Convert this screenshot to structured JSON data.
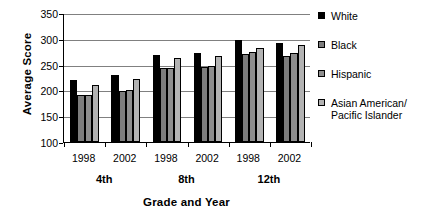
{
  "chart_data": {
    "type": "bar",
    "title": "",
    "xlabel": "Grade and Year",
    "ylabel": "Average Score",
    "ylim": [
      100,
      350
    ],
    "yticks": [
      100,
      150,
      200,
      250,
      300,
      350
    ],
    "grid": true,
    "legend_position": "right",
    "categories": [
      "4th 1998",
      "4th 2002",
      "8th 1998",
      "8th 2002",
      "12th 1998",
      "12th 2002"
    ],
    "group_labels": [
      "4th",
      "8th",
      "12th"
    ],
    "year_labels": [
      "1998",
      "2002",
      "1998",
      "2002",
      "1998",
      "2002"
    ],
    "series": [
      {
        "name": "White",
        "color": "#000000",
        "values": [
          221,
          229,
          268,
          272,
          297,
          292
        ]
      },
      {
        "name": "Black",
        "color": "#7d7d7d",
        "values": [
          191,
          199,
          243,
          245,
          270,
          267
        ]
      },
      {
        "name": "Hispanic",
        "color": "#8e8e8e",
        "values": [
          191,
          201,
          244,
          247,
          275,
          273
        ]
      },
      {
        "name": "Asian American/ Pacific Islander",
        "color": "#b3b3b3",
        "values": [
          210,
          223,
          262,
          267,
          283,
          288
        ]
      }
    ]
  },
  "axis": {
    "y_title": "Average Score",
    "x_title": "Grade and Year",
    "y_ticks": [
      "350",
      "300",
      "250",
      "200",
      "150",
      "100"
    ],
    "x_years": [
      "1998",
      "2002",
      "1998",
      "2002",
      "1998",
      "2002"
    ],
    "x_grades": [
      "4th",
      "8th",
      "12th"
    ]
  },
  "legend": {
    "items": [
      {
        "label": "White",
        "label_line2": "",
        "color": "#000000",
        "swatch": "legend-swatch-white"
      },
      {
        "label": "Black",
        "label_line2": "",
        "color": "#7d7d7d",
        "swatch": "legend-swatch-black"
      },
      {
        "label": "Hispanic",
        "label_line2": "",
        "color": "#8e8e8e",
        "swatch": "legend-swatch-hispanic"
      },
      {
        "label": "Asian American/",
        "label_line2": "Pacific Islander",
        "color": "#b3b3b3",
        "swatch": "legend-swatch-asian"
      }
    ]
  }
}
